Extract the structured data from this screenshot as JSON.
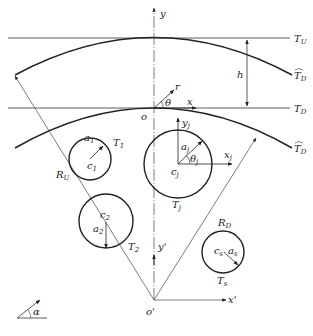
{
  "diagram": {
    "type": "geometry-schematic",
    "lines": {
      "T_U": {
        "label": "T",
        "sub": "U"
      },
      "T_D": {
        "label": "T",
        "sub": "D"
      },
      "T_D_arc_upper": {
        "label": "T",
        "sub": "D",
        "hat": true
      },
      "T_D_arc_lower": {
        "label": "T",
        "sub": "D",
        "hat": true
      }
    },
    "axes": {
      "y": "y",
      "x": "x",
      "r": "r",
      "theta": "θ",
      "origin": "o",
      "y_prime": "y'",
      "x_prime": "x'",
      "origin_prime": "o'"
    },
    "dimensions": {
      "h": "h",
      "R_U": {
        "label": "R",
        "sub": "U"
      },
      "R_D": {
        "label": "R",
        "sub": "D"
      }
    },
    "circles": [
      {
        "name": "T1",
        "label": "T",
        "sub": "1",
        "center": "c",
        "center_sub": "1",
        "radius": "a",
        "radius_sub": "1"
      },
      {
        "name": "Tj",
        "label": "T",
        "sub": "j",
        "center": "c",
        "center_sub": "j",
        "radius": "a",
        "radius_sub": "j",
        "angle": "θ",
        "angle_sub": "j",
        "x_axis": "x",
        "x_sub": "j",
        "y_axis": "y",
        "y_sub": "j"
      },
      {
        "name": "T2",
        "label": "T",
        "sub": "2",
        "center": "c",
        "center_sub": "2",
        "radius": "a",
        "radius_sub": "2"
      },
      {
        "name": "Ts",
        "label": "T",
        "sub": "s",
        "center": "c",
        "center_sub": "s",
        "radius": "a",
        "radius_sub": "s"
      }
    ],
    "legend_angle": "α"
  }
}
